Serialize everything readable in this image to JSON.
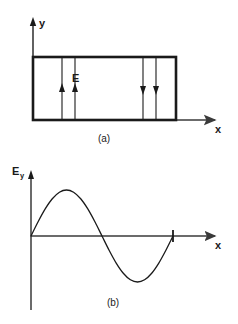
{
  "figure": {
    "background_color": "#ffffff",
    "ink_color": "#1a1a1a",
    "axis_color": "#3a3a3a"
  },
  "panel_a": {
    "label": "(a)",
    "y_axis_label": "y",
    "x_axis_label": "x",
    "field_label": "E",
    "field_lines": [
      {
        "name": "line-1",
        "direction": "up",
        "x": 62
      },
      {
        "name": "line-2",
        "direction": "up",
        "x": 75
      },
      {
        "name": "line-3",
        "direction": "down",
        "x": 143
      },
      {
        "name": "line-4",
        "direction": "down",
        "x": 156
      }
    ],
    "box": {
      "left": 33,
      "top": 57,
      "right": 176,
      "bottom": 120
    }
  },
  "panel_b": {
    "label": "(b)",
    "y_axis_label": "E",
    "y_axis_subscript": "y",
    "x_axis_label": "x",
    "tick_marks": [
      {
        "name": "period-tick",
        "x": 173
      }
    ]
  },
  "chart_data": {
    "type": "line",
    "title": "",
    "xlabel": "x",
    "ylabel": "Ey",
    "grid": false,
    "legend": null,
    "xlim": [
      0,
      1
    ],
    "ylim": [
      -1,
      1
    ],
    "x": [
      0.0,
      0.05,
      0.1,
      0.15,
      0.2,
      0.25,
      0.3,
      0.35,
      0.4,
      0.45,
      0.5,
      0.55,
      0.6,
      0.65,
      0.7,
      0.75,
      0.8,
      0.85,
      0.9,
      0.95,
      1.0
    ],
    "y": [
      0.0,
      0.309,
      0.588,
      0.809,
      0.951,
      1.0,
      0.951,
      0.809,
      0.588,
      0.309,
      0.0,
      -0.309,
      -0.588,
      -0.809,
      -0.951,
      -1.0,
      -0.951,
      -0.809,
      -0.588,
      -0.309,
      0.0
    ],
    "features": {
      "zero_start": 0.0,
      "peak_x": 0.25,
      "peak_y": 1.0,
      "zero_crossing_x": 0.5,
      "trough_x": 0.75,
      "trough_y": -1.0,
      "zero_end": 1.0
    }
  }
}
